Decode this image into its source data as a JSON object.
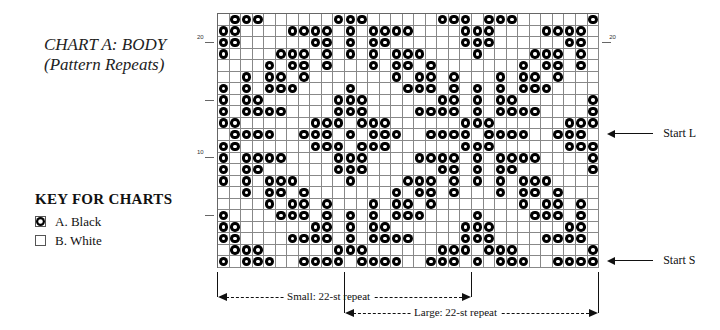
{
  "title": {
    "line1": "CHART A: BODY",
    "line2": "(Pattern Repeats)"
  },
  "key": {
    "title": "KEY FOR CHARTS",
    "items": [
      {
        "symbol": "black-dot",
        "label": "A. Black"
      },
      {
        "symbol": "empty",
        "label": "B. White"
      }
    ]
  },
  "chart": {
    "columns": 33,
    "rows": 22,
    "repeat_width": 22,
    "row_labels_left": [
      {
        "row": 20,
        "text": "20"
      },
      {
        "row": 15,
        "text": ""
      },
      {
        "row": 10,
        "text": "10"
      },
      {
        "row": 5,
        "text": ""
      }
    ],
    "row_labels_right": [
      {
        "row": 20,
        "text": "20"
      }
    ],
    "pattern_rows_top_to_bottom": [
      [
        1,
        2,
        3,
        10,
        11,
        12,
        19,
        20,
        21
      ],
      [
        0,
        1,
        6,
        7,
        8,
        9,
        11,
        13,
        14,
        15,
        16,
        21
      ],
      [
        0,
        1,
        8,
        9,
        11,
        13,
        14,
        21
      ],
      [
        0,
        5,
        6,
        7,
        9,
        11,
        13,
        15,
        16,
        17
      ],
      [
        4,
        6,
        7,
        9,
        13,
        15,
        16,
        18
      ],
      [
        2,
        4,
        5,
        7,
        15,
        17,
        18,
        20
      ],
      [
        0,
        2,
        4,
        5,
        6,
        11,
        16,
        17,
        18,
        20
      ],
      [
        0,
        2,
        3,
        10,
        11,
        12,
        19,
        20
      ],
      [
        0,
        2,
        3,
        4,
        5,
        10,
        11,
        12,
        17,
        18,
        19,
        20
      ],
      [
        0,
        1,
        8,
        9,
        10,
        12,
        13,
        14,
        21
      ],
      [
        1,
        2,
        3,
        4,
        7,
        8,
        9,
        11,
        13,
        14,
        15,
        18,
        19,
        20,
        21
      ],
      [
        0,
        1,
        8,
        9,
        10,
        12,
        13,
        14,
        21
      ],
      [
        0,
        2,
        3,
        4,
        5,
        10,
        11,
        12,
        17,
        18,
        19,
        20
      ],
      [
        0,
        2,
        3,
        10,
        11,
        12,
        19,
        20
      ],
      [
        0,
        2,
        4,
        5,
        6,
        11,
        16,
        17,
        18,
        20
      ],
      [
        2,
        4,
        5,
        7,
        15,
        17,
        18,
        20
      ],
      [
        4,
        6,
        7,
        9,
        13,
        15,
        16,
        18
      ],
      [
        0,
        5,
        6,
        7,
        9,
        11,
        13,
        15,
        16,
        17
      ],
      [
        0,
        1,
        8,
        9,
        11,
        13,
        14,
        21
      ],
      [
        0,
        1,
        6,
        7,
        8,
        9,
        11,
        13,
        14,
        15,
        16,
        21
      ],
      [
        1,
        2,
        3,
        10,
        11,
        12,
        19,
        20,
        21
      ],
      [
        0,
        2,
        3,
        4,
        7,
        8,
        9,
        10,
        12,
        13,
        14,
        15,
        18,
        19,
        20
      ]
    ],
    "start_markers": [
      {
        "label": "Start L",
        "row": 12
      },
      {
        "label": "Start S",
        "row": 1
      }
    ],
    "repeats": [
      {
        "label": "Small: 22-st repeat",
        "from_col": 0,
        "to_col": 22
      },
      {
        "label": "Large: 22-st repeat",
        "from_col": 11,
        "to_col": 33
      }
    ]
  }
}
